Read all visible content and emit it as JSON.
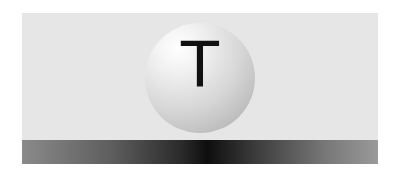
{
  "sphere": {
    "letter": "T"
  },
  "colors": {
    "panel": "#e6e6e6",
    "bar_dark": "#0e0e0e",
    "bar_light": "#9a9a9a"
  }
}
